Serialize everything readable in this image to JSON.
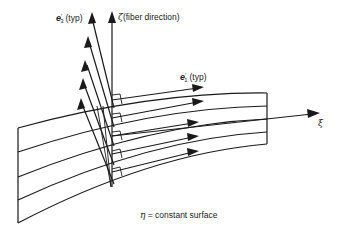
{
  "figure": {
    "labels": {
      "e3_symbol": "e",
      "e3_prime": "′",
      "e3_sub": "3",
      "e3_suffix": "(typ)",
      "zeta_symbol": "ζ",
      "zeta_text": "(fiber direction)",
      "e1_symbol": "e",
      "e1_prime": "′",
      "e1_sub": "1",
      "e1_suffix": "(typ)",
      "xi_symbol": "ξ",
      "eta_caption_symbol": "η",
      "eta_caption_text": " = constant surface"
    },
    "colors": {
      "line": "#1a1a1a",
      "background": "#ffffff"
    },
    "layers": 5
  }
}
